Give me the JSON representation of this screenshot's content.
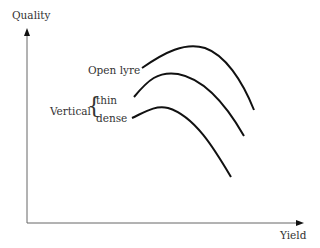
{
  "diagram": {
    "axes": {
      "y_label": "Quality",
      "x_label": "Yield"
    },
    "curves": [
      {
        "name": "Open lyre",
        "label": "Open lyre"
      },
      {
        "name": "Vertical thin",
        "label": "thin"
      },
      {
        "name": "Vertical dense",
        "label": "dense"
      }
    ],
    "group_label": "Vertical",
    "brace": "{"
  }
}
